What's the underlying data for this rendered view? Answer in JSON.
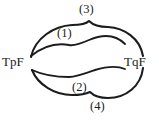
{
  "figure": {
    "type": "hand-drawn-topological-diagram",
    "background_color": "#ffffff",
    "stroke_color": "#1c1c1c",
    "width": 159,
    "height": 120,
    "nodes": [
      {
        "id": "left",
        "label": "TpF",
        "x": 17,
        "y": 62
      },
      {
        "id": "right",
        "label": "TqF",
        "x": 140,
        "y": 62
      }
    ],
    "arcs": [
      {
        "id": "arc-1",
        "label": "(1)",
        "label_x": 68,
        "label_y": 33,
        "position": "upper-inner",
        "from": "left",
        "to": "right",
        "path": "M 31 56 C 46 44, 58 43, 69 45 C 74 46, 80 44, 89 40 C 103 34, 116 35, 125 44"
      },
      {
        "id": "arc-2",
        "label": "(2)",
        "label_x": 83,
        "label_y": 87,
        "position": "lower-inner",
        "from": "left",
        "to": "right",
        "path": "M 32 70 C 45 76, 58 77, 69 77 C 76 77, 84 74, 95 70 C 108 66, 118 66, 125 69"
      },
      {
        "id": "arc-3",
        "label": "(3)",
        "label_x": 90,
        "label_y": 9,
        "position": "upper-outer",
        "from": "left",
        "to": "right",
        "path": "M 31 57 C 35 38, 54 26, 72 25 C 80 25, 86 24, 89 21 C 93 25, 99 27, 108 27 C 124 28, 140 38, 143 56"
      },
      {
        "id": "arc-4",
        "label": "(4)",
        "label_x": 101,
        "label_y": 106,
        "position": "lower-outer",
        "from": "left",
        "to": "right",
        "path": "M 32 70 C 38 85, 55 95, 72 95 C 80 95, 86 94, 90 92 C 94 96, 100 98, 108 98 C 126 98, 141 86, 143 68"
      }
    ]
  }
}
